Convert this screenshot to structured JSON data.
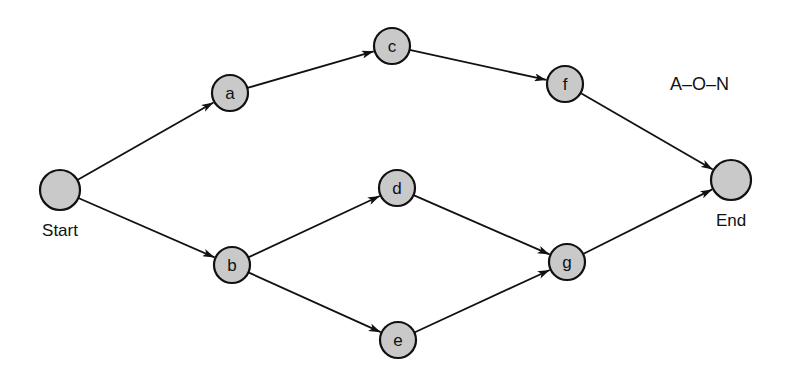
{
  "title": "A–O–N",
  "nodes": [
    {
      "id": "start",
      "label": "",
      "caption": "Start",
      "x": 60,
      "y": 190,
      "r": 20
    },
    {
      "id": "a",
      "label": "a",
      "x": 230,
      "y": 93,
      "r": 18
    },
    {
      "id": "c",
      "label": "c",
      "x": 392,
      "y": 46,
      "r": 18
    },
    {
      "id": "f",
      "label": "f",
      "x": 565,
      "y": 84,
      "r": 18
    },
    {
      "id": "end",
      "label": "",
      "caption": "End",
      "x": 731,
      "y": 180,
      "r": 20
    },
    {
      "id": "b",
      "label": "b",
      "x": 232,
      "y": 265,
      "r": 18
    },
    {
      "id": "d",
      "label": "d",
      "x": 397,
      "y": 188,
      "r": 18
    },
    {
      "id": "e",
      "label": "e",
      "x": 398,
      "y": 340,
      "r": 18
    },
    {
      "id": "g",
      "label": "g",
      "x": 567,
      "y": 262,
      "r": 18
    }
  ],
  "edges": [
    {
      "from": "start",
      "to": "a"
    },
    {
      "from": "start",
      "to": "b"
    },
    {
      "from": "a",
      "to": "c"
    },
    {
      "from": "c",
      "to": "f"
    },
    {
      "from": "f",
      "to": "end"
    },
    {
      "from": "b",
      "to": "d"
    },
    {
      "from": "b",
      "to": "e"
    },
    {
      "from": "d",
      "to": "g"
    },
    {
      "from": "e",
      "to": "g"
    },
    {
      "from": "g",
      "to": "end"
    }
  ]
}
